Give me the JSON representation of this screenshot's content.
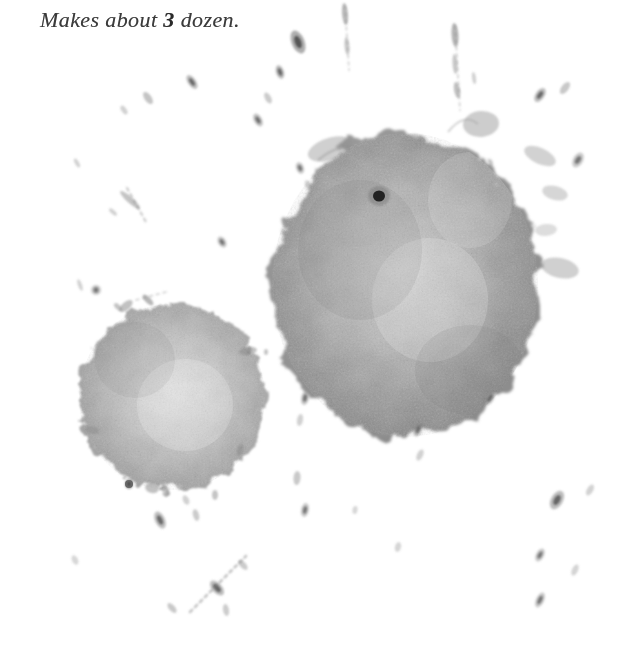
{
  "page": {
    "width": 622,
    "height": 667,
    "background_color": "#ffffff"
  },
  "text": {
    "yield_line_prefix": "Makes about ",
    "yield_quantity": "3",
    "yield_line_suffix": " dozen.",
    "full_line": "Makes about 3 dozen.",
    "color": "#3b3b3b",
    "font_size_px": 22,
    "x": 40,
    "y": 7
  },
  "stains": {
    "ink_color": "#8e8e8e",
    "dark_speck_color": "#3a3a3a",
    "black_spot_color": "#141414",
    "large_blob": {
      "name": "large-stain",
      "center_x": 405,
      "center_y": 285,
      "radius_x": 135,
      "radius_y": 155,
      "opacity": 0.72
    },
    "small_blob": {
      "name": "small-stain",
      "center_x": 172,
      "center_y": 397,
      "radius_x": 95,
      "radius_y": 95,
      "opacity": 0.6
    },
    "black_spot": {
      "name": "dark-core-spot",
      "x": 379,
      "y": 196,
      "radius": 6
    },
    "droplets": [
      {
        "x": 298,
        "y": 42,
        "rx": 6.5,
        "ry": 12,
        "rot": -22,
        "o": 0.62
      },
      {
        "x": 280,
        "y": 72,
        "rx": 4,
        "ry": 7,
        "rot": -18,
        "o": 0.5
      },
      {
        "x": 345,
        "y": 14,
        "rx": 3,
        "ry": 11,
        "rot": -5,
        "o": 0.52
      },
      {
        "x": 347,
        "y": 46,
        "rx": 2.5,
        "ry": 9,
        "rot": -5,
        "o": 0.4
      },
      {
        "x": 455,
        "y": 35,
        "rx": 3.5,
        "ry": 12,
        "rot": -4,
        "o": 0.55
      },
      {
        "x": 455,
        "y": 64,
        "rx": 2.5,
        "ry": 10,
        "rot": -4,
        "o": 0.42
      },
      {
        "x": 457,
        "y": 90,
        "rx": 3,
        "ry": 8,
        "rot": -10,
        "o": 0.48
      },
      {
        "x": 474,
        "y": 78,
        "rx": 2,
        "ry": 6,
        "rot": -8,
        "o": 0.35
      },
      {
        "x": 192,
        "y": 82,
        "rx": 4,
        "ry": 8,
        "rot": -35,
        "o": 0.48
      },
      {
        "x": 148,
        "y": 98,
        "rx": 3.5,
        "ry": 7,
        "rot": -35,
        "o": 0.45
      },
      {
        "x": 124,
        "y": 110,
        "rx": 2.5,
        "ry": 5,
        "rot": -35,
        "o": 0.35
      },
      {
        "x": 258,
        "y": 120,
        "rx": 4,
        "ry": 7,
        "rot": -30,
        "o": 0.45
      },
      {
        "x": 268,
        "y": 98,
        "rx": 3,
        "ry": 6,
        "rot": -28,
        "o": 0.4
      },
      {
        "x": 540,
        "y": 95,
        "rx": 4.5,
        "ry": 8,
        "rot": 35,
        "o": 0.48
      },
      {
        "x": 565,
        "y": 88,
        "rx": 3.5,
        "ry": 7,
        "rot": 38,
        "o": 0.42
      },
      {
        "x": 578,
        "y": 160,
        "rx": 5,
        "ry": 8,
        "rot": 30,
        "o": 0.4
      },
      {
        "x": 300,
        "y": 168,
        "rx": 4,
        "ry": 6,
        "rot": -20,
        "o": 0.4
      },
      {
        "x": 308,
        "y": 185,
        "rx": 3,
        "ry": 5,
        "rot": -20,
        "o": 0.35
      },
      {
        "x": 222,
        "y": 242,
        "rx": 4,
        "ry": 6,
        "rot": -30,
        "o": 0.42
      },
      {
        "x": 130,
        "y": 200,
        "rx": 3,
        "ry": 13,
        "rot": -48,
        "o": 0.45
      },
      {
        "x": 113,
        "y": 212,
        "rx": 2,
        "ry": 5,
        "rot": -48,
        "o": 0.35
      },
      {
        "x": 77,
        "y": 163,
        "rx": 2,
        "ry": 5,
        "rot": -30,
        "o": 0.35
      },
      {
        "x": 80,
        "y": 285,
        "rx": 2,
        "ry": 6,
        "rot": -20,
        "o": 0.35
      },
      {
        "x": 249,
        "y": 350,
        "rx": 2.5,
        "ry": 4,
        "rot": 0,
        "o": 0.55
      },
      {
        "x": 266,
        "y": 352,
        "rx": 2,
        "ry": 3,
        "rot": 0,
        "o": 0.45
      },
      {
        "x": 96,
        "y": 290,
        "rx": 5,
        "ry": 5,
        "rot": 0,
        "o": 0.4
      },
      {
        "x": 305,
        "y": 398,
        "rx": 4,
        "ry": 7,
        "rot": 10,
        "o": 0.42
      },
      {
        "x": 300,
        "y": 420,
        "rx": 3,
        "ry": 6,
        "rot": 10,
        "o": 0.35
      },
      {
        "x": 297,
        "y": 478,
        "rx": 3.5,
        "ry": 7,
        "rot": 5,
        "o": 0.42
      },
      {
        "x": 240,
        "y": 450,
        "rx": 3,
        "ry": 6,
        "rot": 18,
        "o": 0.38
      },
      {
        "x": 418,
        "y": 430,
        "rx": 4,
        "ry": 7,
        "rot": 25,
        "o": 0.42
      },
      {
        "x": 420,
        "y": 455,
        "rx": 3,
        "ry": 6,
        "rot": 25,
        "o": 0.35
      },
      {
        "x": 490,
        "y": 398,
        "rx": 4,
        "ry": 8,
        "rot": 30,
        "o": 0.45
      },
      {
        "x": 557,
        "y": 500,
        "rx": 6,
        "ry": 10,
        "rot": 30,
        "o": 0.5
      },
      {
        "x": 590,
        "y": 490,
        "rx": 3,
        "ry": 6,
        "rot": 30,
        "o": 0.35
      },
      {
        "x": 540,
        "y": 555,
        "rx": 4,
        "ry": 7,
        "rot": 28,
        "o": 0.4
      },
      {
        "x": 540,
        "y": 600,
        "rx": 4,
        "ry": 8,
        "rot": 25,
        "o": 0.42
      },
      {
        "x": 575,
        "y": 570,
        "rx": 3,
        "ry": 6,
        "rot": 25,
        "o": 0.33
      },
      {
        "x": 305,
        "y": 510,
        "rx": 4,
        "ry": 7,
        "rot": 12,
        "o": 0.4
      },
      {
        "x": 160,
        "y": 520,
        "rx": 5,
        "ry": 9,
        "rot": -25,
        "o": 0.48
      },
      {
        "x": 186,
        "y": 500,
        "rx": 3,
        "ry": 5,
        "rot": -25,
        "o": 0.35
      },
      {
        "x": 217,
        "y": 588,
        "rx": 5,
        "ry": 9,
        "rot": -42,
        "o": 0.5
      },
      {
        "x": 243,
        "y": 565,
        "rx": 3,
        "ry": 6,
        "rot": -42,
        "o": 0.4
      },
      {
        "x": 172,
        "y": 608,
        "rx": 3,
        "ry": 6,
        "rot": -42,
        "o": 0.42
      },
      {
        "x": 226,
        "y": 610,
        "rx": 3,
        "ry": 6,
        "rot": -10,
        "o": 0.38
      },
      {
        "x": 75,
        "y": 560,
        "rx": 3,
        "ry": 5,
        "rot": -25,
        "o": 0.3
      },
      {
        "x": 398,
        "y": 547,
        "rx": 3,
        "ry": 5,
        "rot": 15,
        "o": 0.32
      },
      {
        "x": 355,
        "y": 510,
        "rx": 2.5,
        "ry": 4,
        "rot": 10,
        "o": 0.3
      },
      {
        "x": 148,
        "y": 300,
        "rx": 3,
        "ry": 7,
        "rot": -45,
        "o": 0.55
      },
      {
        "x": 118,
        "y": 307,
        "rx": 2.5,
        "ry": 5,
        "rot": -45,
        "o": 0.45
      },
      {
        "x": 129,
        "y": 484,
        "rx": 4,
        "ry": 5,
        "rot": 0,
        "o": 0.72
      },
      {
        "x": 215,
        "y": 495,
        "rx": 3,
        "ry": 5,
        "rot": 0,
        "o": 0.45
      },
      {
        "x": 196,
        "y": 515,
        "rx": 3,
        "ry": 6,
        "rot": -15,
        "o": 0.4
      }
    ],
    "streaks": [
      {
        "x1": 127,
        "y1": 188,
        "x2": 146,
        "y2": 222,
        "w": 2.2,
        "o": 0.4
      },
      {
        "x1": 190,
        "y1": 612,
        "x2": 246,
        "y2": 556,
        "w": 2.6,
        "o": 0.45
      },
      {
        "x1": 345,
        "y1": 6,
        "x2": 349,
        "y2": 70,
        "w": 1.8,
        "o": 0.3
      },
      {
        "x1": 455,
        "y1": 26,
        "x2": 460,
        "y2": 110,
        "w": 1.8,
        "o": 0.32
      },
      {
        "x1": 136,
        "y1": 300,
        "x2": 166,
        "y2": 292,
        "w": 1.6,
        "o": 0.35
      }
    ],
    "tendrils": [
      {
        "x": 330,
        "y": 148,
        "rx": 22,
        "ry": 11,
        "rot": -18,
        "o": 0.45
      },
      {
        "x": 362,
        "y": 152,
        "rx": 10,
        "ry": 8,
        "rot": 10,
        "o": 0.4
      },
      {
        "x": 412,
        "y": 142,
        "rx": 12,
        "ry": 9,
        "rot": -10,
        "o": 0.42
      },
      {
        "x": 540,
        "y": 155,
        "rx": 16,
        "ry": 8,
        "rot": 25,
        "o": 0.4
      },
      {
        "x": 553,
        "y": 192,
        "rx": 12,
        "ry": 7,
        "rot": 15,
        "o": 0.36
      },
      {
        "x": 560,
        "y": 268,
        "rx": 18,
        "ry": 9,
        "rot": 12,
        "o": 0.42
      },
      {
        "x": 478,
        "y": 120,
        "rx": 16,
        "ry": 12,
        "rot": -5,
        "o": 0.4
      }
    ]
  },
  "colors": {
    "paper": "#ffffff",
    "stain_mid": "#999999",
    "stain_dark": "#6e6e6e",
    "stain_light": "#bdbdbd",
    "ink": "#3b3b3b"
  }
}
